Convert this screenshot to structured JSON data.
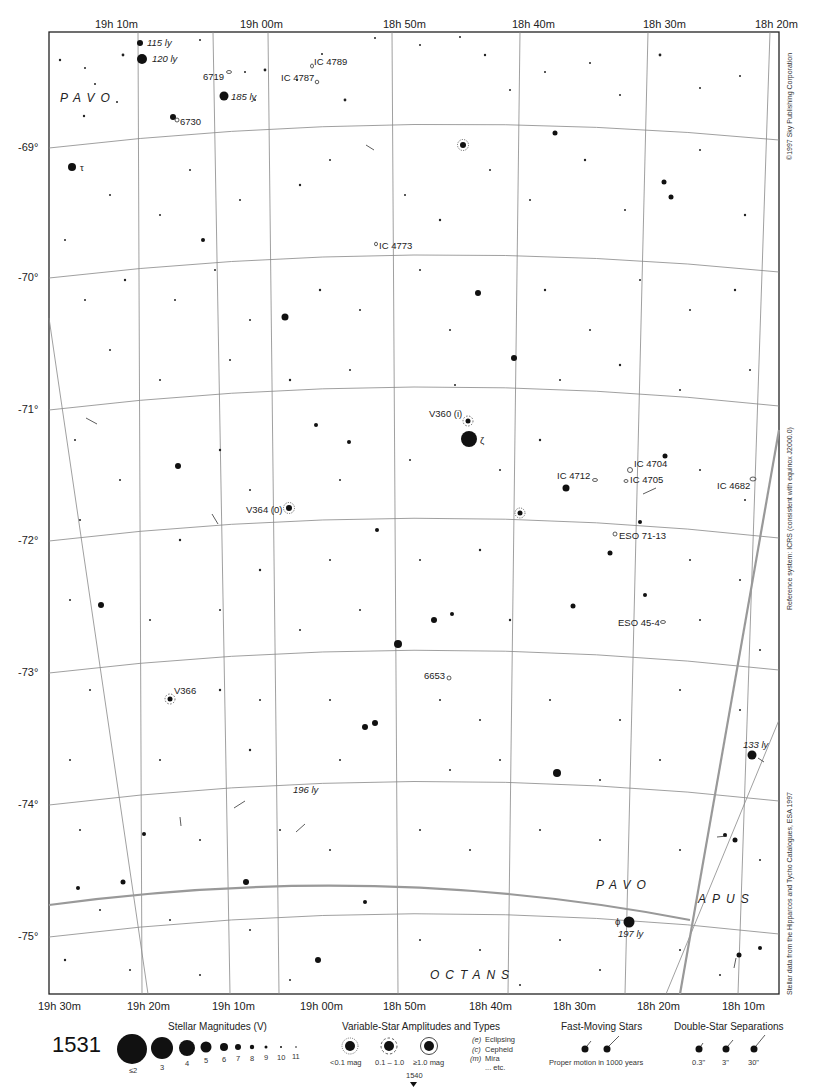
{
  "chart_title": "",
  "page_number": "1531",
  "next_page": "1540",
  "ra_labels_top": [
    "19h 10m",
    "19h 00m",
    "18h 50m",
    "18h 40m",
    "18h 30m",
    "18h 20m"
  ],
  "ra_labels_bottom": [
    "19h 30m",
    "19h 20m",
    "19h 10m",
    "19h 00m",
    "18h 50m",
    "18h 40m",
    "18h 30m",
    "18h 20m",
    "18h 10m"
  ],
  "dec_labels": [
    "-69°",
    "-70°",
    "-71°",
    "-72°",
    "-73°",
    "-74°",
    "-75°"
  ],
  "constellations": [
    {
      "name": "PAVO",
      "x": 60,
      "y": 102
    },
    {
      "name": "PAVO",
      "x": 596,
      "y": 889
    },
    {
      "name": "APUS",
      "x": 698,
      "y": 903
    },
    {
      "name": "OCTANS",
      "x": 430,
      "y": 979
    }
  ],
  "labels": {
    "ly_115": "115 ly",
    "ly_120": "120 ly",
    "ly_185": "185 ly",
    "ly_196": "196 ly",
    "ly_133": "133 ly",
    "ly_197": "197 ly",
    "ngc_6719": "6719",
    "ngc_6730": "6730",
    "ngc_6653": "6653",
    "ic_4789": "IC 4789",
    "ic_4787": "IC 4787",
    "ic_4773": "IC 4773",
    "ic_4712": "IC 4712",
    "ic_4704": "IC 4704",
    "ic_4705": "IC 4705",
    "ic_4682": "IC 4682",
    "eso_71_13": "ESO 71-13",
    "eso_45_4": "ESO 45-4",
    "v360": "V360 (i)",
    "v364": "V364 (0)",
    "v366": "V366",
    "zeta": "ζ",
    "tau": "τ",
    "phi": "ϕ"
  },
  "side_notes": {
    "copyright": "©1997 Sky Publishing Corporation",
    "reference": "Reference system: ICRS (consistent with equinox J2000.0)",
    "data_source": "Stellar data from the Hipparcos and Tycho Catalogues, ESA 1997"
  },
  "legend": {
    "magnitudes": {
      "title": "Stellar Magnitudes (V)",
      "items": [
        "≤2",
        "3",
        "4",
        "5",
        "6",
        "7",
        "8",
        "9",
        "10",
        "11"
      ]
    },
    "variables": {
      "title": "Variable-Star Amplitudes and Types",
      "amplitudes": [
        "<0.1 mag",
        "0.1 – 1.0",
        "≥1.0 mag"
      ],
      "types": [
        {
          "code": "(e)",
          "name": "Eclipsing"
        },
        {
          "code": "(c)",
          "name": "Cepheid"
        },
        {
          "code": "(m)",
          "name": "Mira"
        },
        {
          "code": "",
          "name": "... etc."
        }
      ]
    },
    "fast_moving": {
      "title": "Fast-Moving Stars",
      "caption": "Proper motion in 1000 years"
    },
    "double_stars": {
      "title": "Double-Star Separations",
      "items": [
        "0.3\"",
        "3\"",
        "30\""
      ]
    }
  }
}
